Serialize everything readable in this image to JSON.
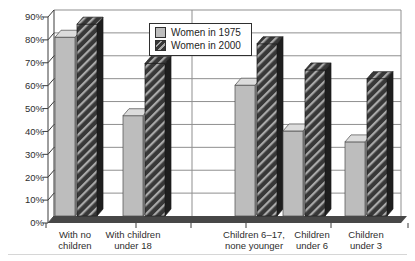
{
  "chart_data": {
    "type": "bar",
    "title": "",
    "xlabel": "",
    "ylabel": "",
    "categories": [
      "With no children",
      "With children under 18",
      "Children 6–17, none younger",
      "Children under 6",
      "Children under 3"
    ],
    "category_label_lines": [
      [
        "With no",
        "children"
      ],
      [
        "With children",
        "under 18"
      ],
      [
        "Children 6–17,",
        "none younger"
      ],
      [
        "Children",
        "under 6"
      ],
      [
        "Children",
        "under 3"
      ]
    ],
    "series": [
      {
        "name": "Women in 1975",
        "values": [
          82,
          46,
          60,
          39,
          34
        ],
        "pattern": "solid"
      },
      {
        "name": "Women in 2000",
        "values": [
          88,
          70,
          79,
          67,
          63
        ],
        "pattern": "diagonal-hatch"
      }
    ],
    "ylim": [
      0,
      90
    ],
    "ytick_step": 10,
    "ytick_labels": [
      "0%",
      "10%",
      "20%",
      "30%",
      "40%",
      "50%",
      "60%",
      "70%",
      "80%",
      "90%"
    ],
    "grid": true,
    "legend_position": "top-center",
    "style": {
      "effect": "3d-columns",
      "series_colors": [
        "#bdbdbd",
        "#383838"
      ],
      "gray_top_color": "#dcdcdc",
      "gray_side_color": "#9e9e9e",
      "hatch_stripe_color": "#a9a9a9",
      "dark_side_color": "#1e1e1e",
      "gridline_color": "#8f8f8f",
      "axis_color": "#3c3c3c",
      "text_color": "#2e2e2e",
      "floor_color": "#474747",
      "background": "#ffffff"
    }
  }
}
